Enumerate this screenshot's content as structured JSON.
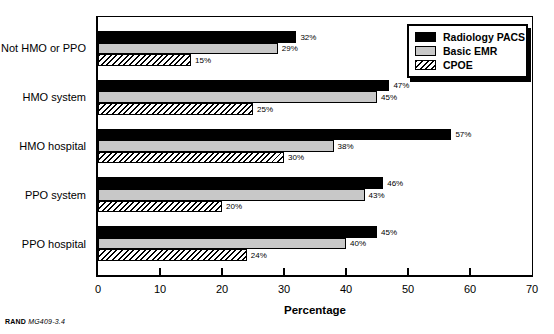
{
  "chart_data": {
    "type": "bar",
    "orientation": "horizontal",
    "title": "",
    "xlabel": "Percentage",
    "xlim": [
      0,
      70
    ],
    "xticks": [
      0,
      10,
      20,
      30,
      40,
      50,
      60,
      70
    ],
    "grid": false,
    "legend_position": "top-right",
    "value_suffix": "%",
    "categories": [
      "Not HMO or PPO",
      "HMO system",
      "HMO hospital",
      "PPO system",
      "PPO hospital"
    ],
    "series": [
      {
        "name": "Radiology PACS",
        "style": "solid-black",
        "color": "#000000",
        "values": [
          32,
          47,
          57,
          46,
          45
        ]
      },
      {
        "name": "Basic EMR",
        "style": "solid-gray",
        "color": "#c8c8c8",
        "values": [
          29,
          45,
          38,
          43,
          40
        ]
      },
      {
        "name": "CPOE",
        "style": "hatched",
        "color": "#000000 on #ffffff diagonal hatch",
        "values": [
          15,
          25,
          30,
          20,
          24
        ]
      }
    ]
  },
  "footer": {
    "brand": "RAND",
    "doc": "MG409-3.4"
  }
}
